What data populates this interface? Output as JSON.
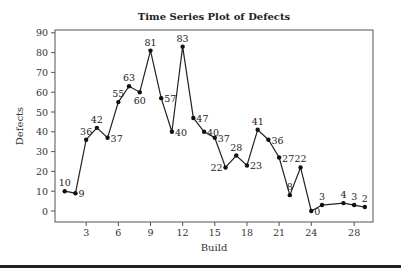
{
  "chart_data": {
    "type": "line",
    "title": "Time Series Plot of Defects",
    "xlabel": "Build",
    "ylabel": "Defects",
    "ylim": [
      -5,
      90
    ],
    "xlim": [
      0,
      30
    ],
    "yticks": [
      0,
      10,
      20,
      30,
      40,
      50,
      60,
      70,
      80,
      90
    ],
    "xticks": [
      3,
      6,
      9,
      12,
      15,
      18,
      21,
      24,
      28
    ],
    "grid": false,
    "legend": "none",
    "x": [
      1,
      2,
      3,
      4,
      5,
      6,
      7,
      8,
      9,
      10,
      11,
      12,
      13,
      14,
      15,
      16,
      17,
      18,
      19,
      20,
      21,
      22,
      23,
      24,
      25,
      27,
      28,
      29
    ],
    "values": [
      10,
      9,
      36,
      42,
      37,
      55,
      63,
      60,
      81,
      57,
      40,
      83,
      47,
      40,
      37,
      22,
      28,
      23,
      41,
      36,
      27,
      8,
      22,
      0,
      3,
      4,
      3,
      2
    ],
    "label_positions": [
      "above",
      "right",
      "above",
      "above",
      "right",
      "above",
      "above",
      "below",
      "above",
      "right",
      "right",
      "above",
      "right",
      "right",
      "right",
      "left",
      "above",
      "right",
      "above",
      "right",
      "right",
      "above",
      "above",
      "right",
      "above",
      "above",
      "above",
      "above"
    ]
  }
}
